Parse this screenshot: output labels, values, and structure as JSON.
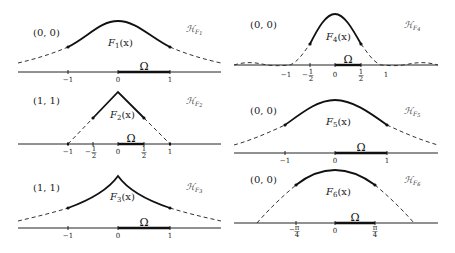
{
  "panels": [
    {
      "id": "F1",
      "corner_label": "(0, 0)",
      "function_label": "F₁(x)",
      "space_label": "ℋ_F₁",
      "space_label_main": "ℋ",
      "space_label_sub": "F₁",
      "domain_label": "Ω",
      "ticks": [
        "−1",
        "0",
        "1"
      ],
      "shape": "gaussian-bump"
    },
    {
      "id": "F2",
      "corner_label": "(1, 1)",
      "function_label": "F₂(x)",
      "space_label_main": "ℋ",
      "space_label_sub": "F₂",
      "domain_label": "Ω",
      "ticks": [
        "−1",
        "−½",
        "0",
        "½",
        "1"
      ],
      "ticks_num": [
        "−1",
        "−1",
        "0",
        "1",
        "1"
      ],
      "ticks_den": [
        "",
        "2",
        "",
        "2",
        ""
      ],
      "shape": "triangle"
    },
    {
      "id": "F3",
      "corner_label": "(1, 1)",
      "function_label": "F₃(x)",
      "space_label_main": "ℋ",
      "space_label_sub": "F₃",
      "domain_label": "Ω",
      "ticks": [
        "−1",
        "0",
        "1"
      ],
      "shape": "cusp-exponential"
    },
    {
      "id": "F4",
      "corner_label": "(0, 0)",
      "function_label": "F₄(x)",
      "space_label_main": "ℋ",
      "space_label_sub": "F₄",
      "domain_label": "Ω",
      "ticks": [
        "−1",
        "−½",
        "0",
        "½",
        "1"
      ],
      "shape": "narrow-bump-with-sidelobes"
    },
    {
      "id": "F5",
      "corner_label": "(0, 0)",
      "function_label": "F₅(x)",
      "space_label_main": "ℋ",
      "space_label_sub": "F₅",
      "domain_label": "Ω",
      "ticks": [
        "−1",
        "0",
        "1"
      ],
      "shape": "wide-bump"
    },
    {
      "id": "F6",
      "corner_label": "(0, 0)",
      "function_label": "F₆(x)",
      "space_label_main": "ℋ",
      "space_label_sub": "F₆",
      "domain_label": "Ω",
      "ticks": [
        "−π/4",
        "0",
        "π/4"
      ],
      "shape": "cosine-arch"
    }
  ],
  "text": {
    "p1": {
      "corner": "(0, 0)",
      "fn": "F",
      "fnsub": "1",
      "fnarg": "(x)",
      "h": "ℋ",
      "hsub": "F",
      "hsubsub": "1",
      "omega": "Ω",
      "t_m1": "−1",
      "t_0": "0",
      "t_1": "1"
    },
    "p2": {
      "corner": "(1, 1)",
      "fn": "F",
      "fnsub": "2",
      "fnarg": "(x)",
      "h": "ℋ",
      "hsub": "F",
      "hsubsub": "2",
      "omega": "Ω",
      "t_m1": "−1",
      "t_mh": "−1",
      "t_0": "0",
      "t_h": "1",
      "t_1": "1",
      "den": "2",
      "neg": "−"
    },
    "p3": {
      "corner": "(1, 1)",
      "fn": "F",
      "fnsub": "3",
      "fnarg": "(x)",
      "h": "ℋ",
      "hsub": "F",
      "hsubsub": "3",
      "omega": "Ω",
      "t_m1": "−1",
      "t_0": "0",
      "t_1": "1"
    },
    "p4": {
      "corner": "(0, 0)",
      "fn": "F",
      "fnsub": "4",
      "fnarg": "(x)",
      "h": "ℋ",
      "hsub": "F",
      "hsubsub": "4",
      "omega": "Ω",
      "t_m1": "−1",
      "t_mh": "1",
      "t_0": "0",
      "t_h": "1",
      "t_1": "1",
      "den": "2",
      "neg": "−"
    },
    "p5": {
      "corner": "(0, 0)",
      "fn": "F",
      "fnsub": "5",
      "fnarg": "(x)",
      "h": "ℋ",
      "hsub": "F",
      "hsubsub": "5",
      "omega": "Ω",
      "t_m1": "−1",
      "t_0": "0",
      "t_1": "1"
    },
    "p6": {
      "corner": "(0, 0)",
      "fn": "F",
      "fnsub": "6",
      "fnarg": "(x)",
      "h": "ℋ",
      "hsub": "F",
      "hsubsub": "6",
      "omega": "Ω",
      "t_mpi": "π",
      "t_0": "0",
      "t_pi": "π",
      "den": "4",
      "neg": "−"
    }
  }
}
